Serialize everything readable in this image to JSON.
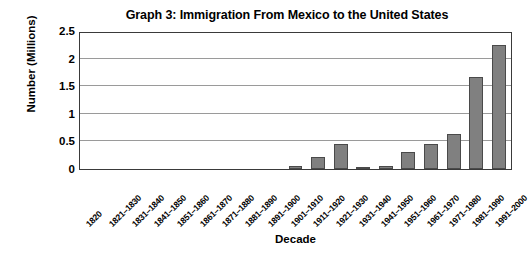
{
  "chart_data": {
    "type": "bar",
    "title": "Graph 3: Immigration From Mexico to the United States",
    "xlabel": "Decade",
    "ylabel": "Number (Millions)",
    "ylim": [
      0,
      2.5
    ],
    "ytick_labels": [
      "2.5",
      "2",
      "1.5",
      "1",
      "0.5",
      "0"
    ],
    "yticks": [
      2.5,
      2,
      1.5,
      1,
      0.5,
      0
    ],
    "grid": true,
    "legend": "none",
    "bar_color": "#808080",
    "bar_border_color": "#4a4a4a",
    "gridline_color": "#9a9a9a",
    "axis_color": "#3a3a3a",
    "categories": [
      "1820",
      "1821–1830",
      "1831–1840",
      "1841–1850",
      "1851–1860",
      "1861–1870",
      "1871–1880",
      "1881–1890",
      "1891–1900",
      "1901–1910",
      "1911–1920",
      "1921–1930",
      "1931–1940",
      "1941–1950",
      "1951–1960",
      "1961–1970",
      "1971–1980",
      "1981–1990",
      "1991–2000"
    ],
    "values": [
      0,
      0,
      0,
      0,
      0,
      0,
      0,
      0,
      0,
      0.05,
      0.22,
      0.46,
      0.02,
      0.06,
      0.3,
      0.45,
      0.64,
      1.66,
      2.25
    ]
  }
}
